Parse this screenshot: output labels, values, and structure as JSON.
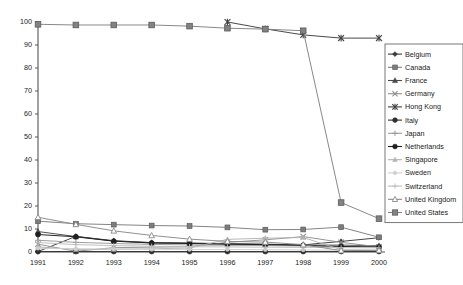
{
  "chart_data": {
    "type": "line",
    "title": "",
    "subtitle": "",
    "xlabel": "",
    "ylabel": "",
    "x": [
      1991,
      1992,
      1993,
      1994,
      1995,
      1996,
      1997,
      1998,
      1999,
      2000
    ],
    "categories": [
      "1991",
      "1992",
      "1993",
      "1994",
      "1995",
      "1996",
      "1997",
      "1998",
      "1999",
      "2000"
    ],
    "xlim": [
      1991,
      2000
    ],
    "ylim": [
      0,
      100
    ],
    "y_ticks": [
      0,
      10,
      20,
      30,
      40,
      50,
      60,
      70,
      80,
      90,
      100
    ],
    "y_tick_labels": [
      "0",
      "10",
      "20",
      "30",
      "40",
      "50",
      "60",
      "70",
      "80",
      "90",
      "100"
    ],
    "grid": false,
    "legend_position": "right",
    "series": [
      {
        "name": "Belgium",
        "marker": "filled-diamond",
        "color": "#3a3a3a",
        "values": [
          0.2,
          6.8,
          4.9,
          4.1,
          3.9,
          3.6,
          3.4,
          3.1,
          4.6,
          6.2
        ]
      },
      {
        "name": "Canada",
        "marker": "filled-square",
        "color": "#7d7d7d",
        "values": [
          13.4,
          12.3,
          11.9,
          11.5,
          11.3,
          10.7,
          9.7,
          9.8,
          10.8,
          6.4
        ]
      },
      {
        "name": "France",
        "marker": "filled-triangle",
        "color": "#4a4a4a",
        "values": [
          8.9,
          6.7,
          4.8,
          4.0,
          3.8,
          3.5,
          3.3,
          3.0,
          3.0,
          2.7
        ]
      },
      {
        "name": "Germany",
        "marker": "cross-x",
        "color": "#8f8f8f",
        "values": [
          3.4,
          0.3,
          1.9,
          2.1,
          2.3,
          4.2,
          5.3,
          6.7,
          4.2,
          2.2
        ]
      },
      {
        "name": "Hong Kong",
        "marker": "asterisk",
        "color": "#3f3f3f",
        "values": [
          null,
          null,
          null,
          null,
          null,
          100.0,
          97.0,
          94.4,
          93.0,
          93.0
        ]
      },
      {
        "name": "Italy",
        "marker": "filled-circle",
        "color": "#2e2e2e",
        "values": [
          0.2,
          0.2,
          0.2,
          0.2,
          0.2,
          0.2,
          0.2,
          0.2,
          0.2,
          0.2
        ]
      },
      {
        "name": "Japan",
        "marker": "plus",
        "color": "#9a9a9a",
        "values": [
          5.1,
          4.2,
          3.7,
          3.3,
          3.1,
          2.9,
          2.8,
          2.6,
          2.5,
          2.4
        ]
      },
      {
        "name": "Netherlands",
        "marker": "filled-circle",
        "color": "#1f1f1f",
        "values": [
          7.6,
          6.6,
          4.7,
          3.9,
          3.7,
          3.4,
          3.2,
          2.9,
          2.4,
          2.2
        ]
      },
      {
        "name": "Singapore",
        "marker": "light-triangle",
        "color": "#b3b3b3",
        "values": [
          2.2,
          1.1,
          1.2,
          1.4,
          1.7,
          5.5,
          6.0,
          6.3,
          1.0,
          0.8
        ]
      },
      {
        "name": "Sweden",
        "marker": "light-dot",
        "color": "#cfcfcf",
        "values": [
          1.6,
          1.4,
          1.3,
          1.2,
          1.1,
          1.1,
          1.0,
          0.9,
          0.8,
          0.7
        ]
      },
      {
        "name": "Switzerland",
        "marker": "light-plus",
        "color": "#bdbdbd",
        "values": [
          4.1,
          3.2,
          2.8,
          2.5,
          2.3,
          2.2,
          2.1,
          2.0,
          1.9,
          1.8
        ]
      },
      {
        "name": "United Kingdom",
        "marker": "open-triangle",
        "color": "#8a8a8a",
        "values": [
          15.1,
          12.0,
          9.2,
          7.2,
          5.6,
          4.6,
          4.3,
          3.2,
          0.6,
          0.7
        ]
      },
      {
        "name": "United States",
        "marker": "filled-square-large",
        "color": "#828282",
        "values": [
          99.0,
          98.7,
          98.7,
          98.7,
          98.2,
          97.3,
          96.9,
          96.2,
          21.5,
          14.5
        ]
      }
    ]
  },
  "legend": {
    "entries": [
      "Belgium",
      "Canada",
      "France",
      "Germany",
      "Hong Kong",
      "Italy",
      "Japan",
      "Netherlands",
      "Singapore",
      "Sweden",
      "Switzerland",
      "United Kingdom",
      "United States"
    ]
  },
  "axes": {
    "y_tick_labels": [
      "0",
      "10",
      "20",
      "30",
      "40",
      "50",
      "60",
      "70",
      "80",
      "90",
      "100"
    ],
    "x_tick_labels": [
      "1991",
      "1992",
      "1993",
      "1994",
      "1995",
      "1996",
      "1997",
      "1998",
      "1999",
      "2000"
    ]
  },
  "colors": {
    "background": "#ffffff",
    "axis": "#555555",
    "text": "#1a1a1a",
    "legend_border": "#6a6a6a"
  }
}
